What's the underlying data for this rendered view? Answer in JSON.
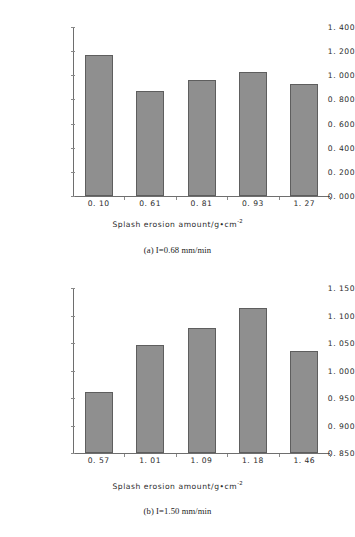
{
  "figure": {
    "panels": [
      {
        "id": "a",
        "caption": "(a) I=0.68 mm/min",
        "chart_data": {
          "type": "bar",
          "title": "",
          "xlabel": "Splash erosion amount/g•cm",
          "xlabel_sup": "-2",
          "ylabel_line1": "Change of soil surface",
          "ylabel_line2": "roughness/(R/R₀)",
          "categories": [
            "0. 10",
            "0. 61",
            "0. 81",
            "0. 93",
            "1. 27"
          ],
          "values": [
            1.17,
            0.868,
            0.965,
            1.026,
            0.925
          ],
          "ylim": [
            0.0,
            1.4
          ],
          "ystep": 0.2,
          "yticks": [
            "0. 000",
            "0. 200",
            "0. 400",
            "0. 600",
            "0. 800",
            "1. 000",
            "1. 200",
            "1. 400"
          ],
          "ytick_values": [
            0.0,
            0.2,
            0.4,
            0.6,
            0.8,
            1.0,
            1.2,
            1.4
          ],
          "grid": false,
          "legend": "none",
          "bar_color": "#8f8f8f",
          "bar_border_color": "#5e5e5e"
        }
      },
      {
        "id": "b",
        "caption": "(b) I=1.50 mm/min",
        "chart_data": {
          "type": "bar",
          "title": "",
          "xlabel": "Splash erosion amount/g•cm",
          "xlabel_sup": "-2",
          "ylabel_line1": "Change of soil surface",
          "ylabel_line2": "roughness/(R/R₀)",
          "categories": [
            "0. 57",
            "1. 01",
            "1. 09",
            "1. 18",
            "1. 46"
          ],
          "values": [
            0.961,
            1.046,
            1.077,
            1.114,
            1.036
          ],
          "ylim": [
            0.85,
            1.15
          ],
          "ystep": 0.05,
          "yticks": [
            "0. 850",
            "0. 900",
            "0. 950",
            "1. 000",
            "1. 050",
            "1. 100",
            "1. 150"
          ],
          "ytick_values": [
            0.85,
            0.9,
            0.95,
            1.0,
            1.05,
            1.1,
            1.15
          ],
          "grid": false,
          "legend": "none",
          "bar_color": "#8f8f8f",
          "bar_border_color": "#5e5e5e"
        }
      }
    ]
  }
}
